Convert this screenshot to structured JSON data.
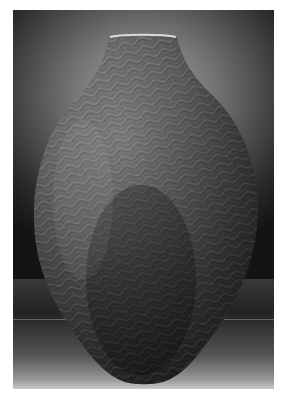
{
  "image": {
    "subject": "textured ceramic vase",
    "description": "Tall ovoid vessel with narrow cylindrical neck, surface covered in dense wavy incised patterns, photographed against a dark gradient studio backdrop",
    "colors": {
      "margin": "#ffffff",
      "backdrop_light": "#a8a8a8",
      "backdrop_dark": "#141414",
      "vase_light": "#9c9c9c",
      "vase_mid": "#6a6a6a",
      "vase_dark": "#2e2e2e",
      "rim_highlight": "#d8d8d8"
    }
  }
}
